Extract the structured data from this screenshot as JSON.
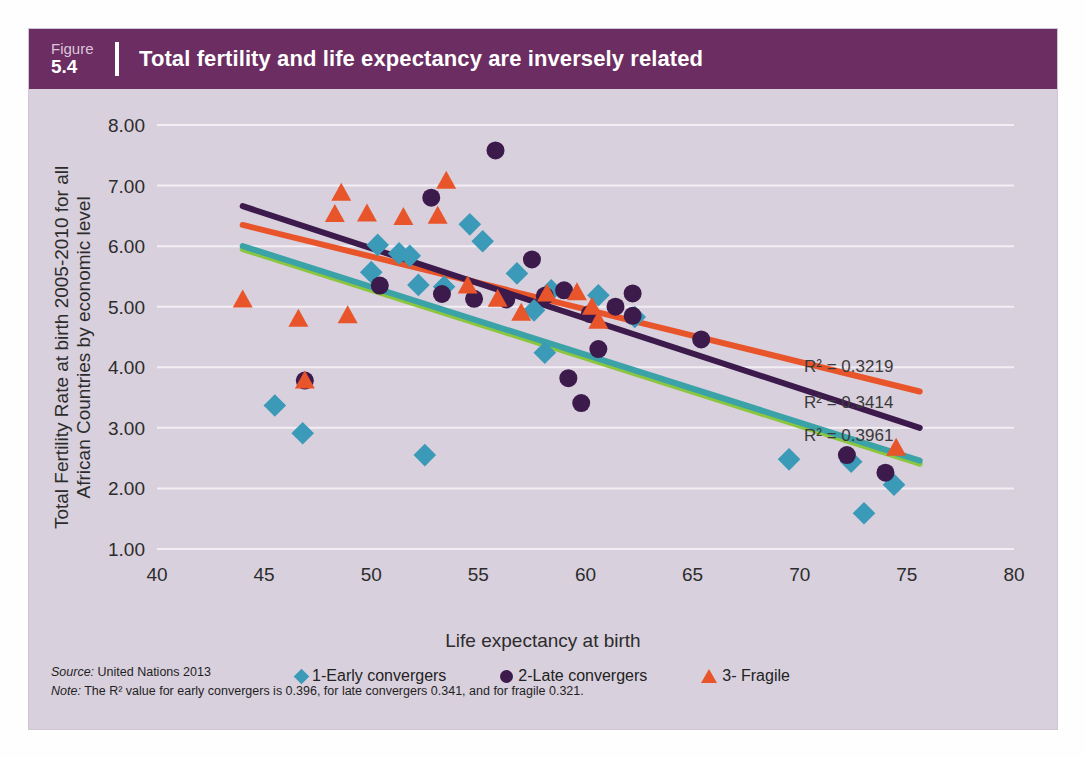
{
  "figure": {
    "label_word": "Figure",
    "number": "5.4",
    "title": "Total fertility and life expectancy are inversely related"
  },
  "footnotes": {
    "source_lead": "Source:",
    "source_text": " United Nations 2013",
    "note_lead": "Note:",
    "note_text": " The R² value for early convergers is 0.396, for late convergers 0.341, and for fragile 0.321."
  },
  "colors": {
    "header_purple": "#6b2d62",
    "panel_bg": "#d9d0dd",
    "early_blue": "#3b9ab8",
    "late_purple": "#3c1a4b",
    "fragile_orange": "#e8552a",
    "trend_early_teal": "#3ba3a8",
    "trend_early_green": "#8cc63f",
    "gridline": "#f2eef4"
  },
  "chart_data": {
    "type": "scatter",
    "title": "Total fertility and life expectancy are inversely related",
    "xlabel": "Life expectancy at birth",
    "ylabel": "Total Fertility Rate at birth 2005-2010 for all African Countries by economic level",
    "xlim": [
      40,
      80
    ],
    "ylim": [
      1.0,
      8.0
    ],
    "xticks": [
      40,
      45,
      50,
      55,
      60,
      65,
      70,
      75,
      80
    ],
    "yticks": [
      "1.00",
      "2.00",
      "3.00",
      "4.00",
      "5.00",
      "6.00",
      "7.00",
      "8.00"
    ],
    "grid": "horizontal",
    "legend_position": "bottom",
    "series": [
      {
        "name": "1-Early convergers",
        "marker": "diamond",
        "color": "#3b9ab8",
        "r2": "0.3961",
        "r2_label": "R² = 0.3961",
        "points": [
          [
            45.5,
            3.37
          ],
          [
            46.8,
            2.91
          ],
          [
            50.3,
            6.02
          ],
          [
            50.0,
            5.57
          ],
          [
            51.3,
            5.88
          ],
          [
            51.8,
            5.84
          ],
          [
            52.2,
            5.36
          ],
          [
            52.5,
            2.55
          ],
          [
            53.4,
            5.33
          ],
          [
            54.6,
            6.36
          ],
          [
            55.2,
            6.08
          ],
          [
            56.8,
            5.55
          ],
          [
            57.6,
            4.94
          ],
          [
            58.4,
            5.27
          ],
          [
            58.1,
            4.24
          ],
          [
            60.6,
            5.19
          ],
          [
            62.3,
            4.83
          ],
          [
            69.5,
            2.48
          ],
          [
            73.0,
            1.59
          ],
          [
            74.4,
            2.06
          ],
          [
            72.4,
            2.44
          ]
        ]
      },
      {
        "name": "2-Late convergers",
        "marker": "circle",
        "color": "#3c1a4b",
        "r2": "0.3414",
        "r2_label": "R² = 0.3414",
        "points": [
          [
            46.9,
            3.78
          ],
          [
            50.4,
            5.35
          ],
          [
            52.8,
            6.8
          ],
          [
            53.3,
            5.21
          ],
          [
            55.8,
            7.58
          ],
          [
            54.8,
            5.13
          ],
          [
            56.3,
            5.12
          ],
          [
            57.5,
            5.78
          ],
          [
            58.1,
            5.18
          ],
          [
            59.0,
            5.27
          ],
          [
            59.2,
            3.82
          ],
          [
            59.8,
            3.41
          ],
          [
            60.2,
            4.88
          ],
          [
            60.6,
            4.3
          ],
          [
            61.4,
            5.0
          ],
          [
            62.2,
            5.22
          ],
          [
            62.2,
            4.85
          ],
          [
            65.4,
            4.46
          ],
          [
            74.0,
            2.26
          ],
          [
            72.2,
            2.55
          ]
        ]
      },
      {
        "name": "3- Fragile",
        "marker": "triangle",
        "color": "#e8552a",
        "r2": "0.3219",
        "r2_label": "R² = 0.3219",
        "points": [
          [
            44.0,
            5.12
          ],
          [
            46.9,
            3.78
          ],
          [
            46.6,
            4.8
          ],
          [
            48.3,
            6.53
          ],
          [
            48.6,
            6.88
          ],
          [
            48.9,
            4.86
          ],
          [
            49.8,
            6.54
          ],
          [
            51.5,
            6.48
          ],
          [
            53.5,
            7.08
          ],
          [
            53.1,
            6.5
          ],
          [
            54.5,
            5.35
          ],
          [
            55.9,
            5.13
          ],
          [
            57.0,
            4.9
          ],
          [
            58.2,
            5.22
          ],
          [
            59.6,
            5.24
          ],
          [
            60.3,
            5.0
          ],
          [
            60.6,
            4.77
          ],
          [
            74.5,
            2.67
          ]
        ]
      }
    ],
    "trendlines": [
      {
        "name": "fragile-trend",
        "color": "#e8552a",
        "x0": 44.0,
        "y0": 6.35,
        "x1": 75.6,
        "y1": 3.6
      },
      {
        "name": "late-convergers-trend",
        "color": "#3c1a4b",
        "x0": 44.0,
        "y0": 6.66,
        "x1": 75.6,
        "y1": 3.0
      },
      {
        "name": "early-convergers-trend",
        "color": "#3ba3a8",
        "x0": 44.0,
        "y0": 6.0,
        "x1": 75.6,
        "y1": 2.46
      }
    ]
  }
}
